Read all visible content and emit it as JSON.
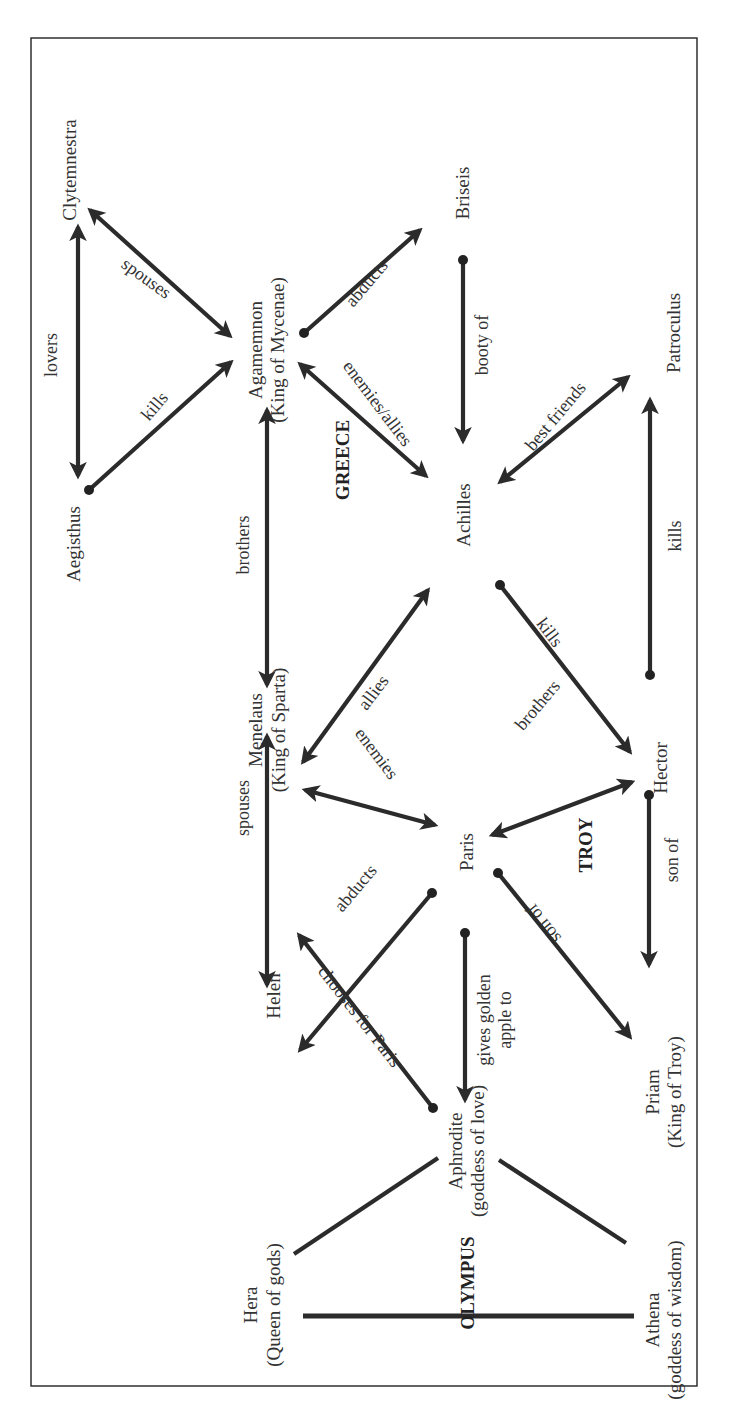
{
  "colors": {
    "line": "#2b2b2b",
    "text": "#333333",
    "background": "#ffffff",
    "frame": "#222222"
  },
  "regions": {
    "greece": "GREECE",
    "troy": "TROY",
    "olympus": "OLYMPUS"
  },
  "nodes": {
    "clytemnestra": {
      "name": "Clytemnestra"
    },
    "aegisthus": {
      "name": "Aegisthus"
    },
    "agamemnon": {
      "name": "Agamemnon",
      "title": "(King of Mycenae)"
    },
    "briseis": {
      "name": "Briseis"
    },
    "achilles": {
      "name": "Achilles"
    },
    "patroculus": {
      "name": "Patroculus"
    },
    "menelaus": {
      "name": "Menelaus",
      "title": "(King of Sparta)"
    },
    "hector": {
      "name": "Hector"
    },
    "paris": {
      "name": "Paris"
    },
    "helen": {
      "name": "Helen"
    },
    "priam": {
      "name": "Priam",
      "title": "(King of Troy)"
    },
    "aphrodite": {
      "name": "Aphrodite",
      "title": "(goddess of love)"
    },
    "hera": {
      "name": "Hera",
      "title": "(Queen of gods)"
    },
    "athena": {
      "name": "Athena",
      "title": "(goddess of wisdom)"
    }
  },
  "edges": [
    {
      "from": "Aegisthus",
      "to": "Clytemnestra",
      "label": "lovers",
      "type": "bidirectional"
    },
    {
      "from": "Clytemnestra",
      "to": "Agamemnon",
      "label": "spouses",
      "type": "bidirectional"
    },
    {
      "from": "Aegisthus",
      "to": "Agamemnon",
      "label": "kills",
      "type": "directed"
    },
    {
      "from": "Agamemnon",
      "to": "Briseis",
      "label": "abducts",
      "type": "directed"
    },
    {
      "from": "Briseis",
      "to": "Achilles",
      "label": "booty of",
      "type": "directed"
    },
    {
      "from": "Agamemnon",
      "to": "Achilles",
      "label": "enemies/allies",
      "type": "bidirectional"
    },
    {
      "from": "Agamemnon",
      "to": "Menelaus",
      "label": "brothers",
      "type": "bidirectional"
    },
    {
      "from": "Menelaus",
      "to": "Achilles",
      "label": "allies",
      "type": "bidirectional"
    },
    {
      "from": "Achilles",
      "to": "Patroculus",
      "label": "best friends",
      "type": "bidirectional"
    },
    {
      "from": "Hector",
      "to": "Patroculus",
      "label": "kills",
      "type": "directed"
    },
    {
      "from": "Achilles",
      "to": "Hector",
      "label": "kills",
      "type": "directed"
    },
    {
      "from": "Menelaus",
      "to": "Paris",
      "label": "enemies",
      "type": "bidirectional"
    },
    {
      "from": "Paris",
      "to": "Hector",
      "label": "brothers",
      "type": "bidirectional"
    },
    {
      "from": "Menelaus",
      "to": "Helen",
      "label": "spouses",
      "type": "bidirectional"
    },
    {
      "from": "Paris",
      "to": "Helen",
      "label": "abducts",
      "type": "directed"
    },
    {
      "from": "Hector",
      "to": "Priam",
      "label": "son of",
      "type": "directed"
    },
    {
      "from": "Paris",
      "to": "Priam",
      "label": "son of",
      "type": "directed"
    },
    {
      "from": "Paris",
      "to": "Aphrodite",
      "label": "gives golden apple to",
      "label_lines": [
        "gives golden",
        "apple to"
      ],
      "type": "directed"
    },
    {
      "from": "Aphrodite",
      "to": "Helen",
      "label": "chooses for Paris",
      "type": "directed"
    },
    {
      "from": "Aphrodite",
      "to": "Hera",
      "label": "",
      "type": "line"
    },
    {
      "from": "Aphrodite",
      "to": "Athena",
      "label": "",
      "type": "line"
    },
    {
      "from": "Hera",
      "to": "Athena",
      "label": "",
      "type": "line"
    }
  ]
}
